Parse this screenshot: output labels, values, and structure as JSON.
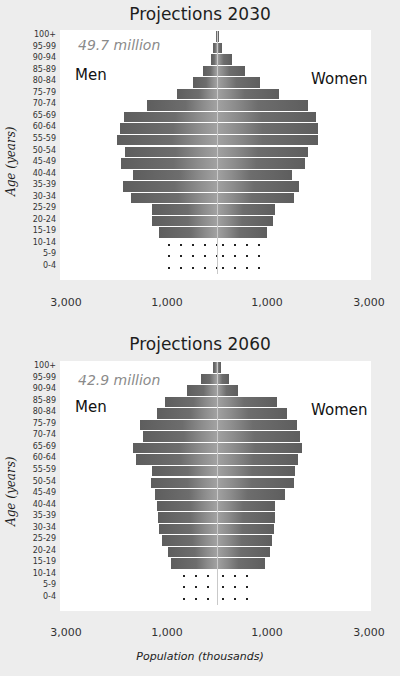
{
  "chart_data": [
    {
      "type": "bar",
      "subtype": "population-pyramid",
      "title": "Projections 2030",
      "total_label": "49.7 million",
      "xlabel": "",
      "ylabel": "Age (years)",
      "left_label": "Men",
      "right_label": "Women",
      "x_ticks": [
        "3,000",
        "1,000",
        "1,000",
        "3,000"
      ],
      "xlim": [
        -3000,
        3000
      ],
      "grid": false,
      "categories": [
        "100+",
        "95-99",
        "90-94",
        "85-89",
        "80-84",
        "75-79",
        "70-74",
        "65-69",
        "60-64",
        "55-59",
        "50-54",
        "45-49",
        "40-44",
        "35-39",
        "30-34",
        "25-29",
        "20-24",
        "15-19",
        "10-14",
        "5-9",
        "0-4"
      ],
      "series": [
        {
          "name": "Men",
          "values": [
            20,
            70,
            120,
            270,
            470,
            780,
            1360,
            1810,
            1880,
            1940,
            1790,
            1860,
            1630,
            1830,
            1670,
            1260,
            1260,
            1130,
            1050,
            1050,
            1050
          ]
        },
        {
          "name": "Women",
          "values": [
            40,
            100,
            290,
            540,
            830,
            1200,
            1770,
            1920,
            1960,
            1960,
            1770,
            1710,
            1460,
            1590,
            1500,
            1130,
            1090,
            970,
            950,
            950,
            950
          ]
        }
      ],
      "dotted_groups": [
        "10-14",
        "5-9",
        "0-4"
      ]
    },
    {
      "type": "bar",
      "subtype": "population-pyramid",
      "title": "Projections 2060",
      "total_label": "42.9 million",
      "xlabel": "Population (thousands)",
      "ylabel": "Age (years)",
      "left_label": "Men",
      "right_label": "Women",
      "x_ticks": [
        "3,000",
        "1,000",
        "1,000",
        "3,000"
      ],
      "xlim": [
        -3000,
        3000
      ],
      "grid": false,
      "categories": [
        "100+",
        "95-99",
        "90-94",
        "85-89",
        "80-84",
        "75-79",
        "70-74",
        "65-69",
        "60-64",
        "55-59",
        "50-54",
        "45-49",
        "40-44",
        "35-39",
        "30-34",
        "25-29",
        "20-24",
        "15-19",
        "10-14",
        "5-9",
        "0-4"
      ],
      "series": [
        {
          "name": "Men",
          "values": [
            70,
            320,
            580,
            1010,
            1160,
            1500,
            1430,
            1640,
            1570,
            1270,
            1290,
            1210,
            1170,
            1150,
            1130,
            1060,
            960,
            890,
            750,
            750,
            750
          ]
        },
        {
          "name": "Women",
          "values": [
            80,
            230,
            400,
            1160,
            1350,
            1560,
            1610,
            1660,
            1570,
            1510,
            1500,
            1320,
            1120,
            1130,
            1100,
            1070,
            1030,
            940,
            740,
            740,
            740
          ]
        }
      ],
      "dotted_groups": [
        "10-14",
        "5-9",
        "0-4"
      ]
    }
  ],
  "ui": {
    "chart1": {
      "title": "Projections 2030",
      "total": "49.7 million",
      "men": "Men",
      "women": "Women"
    },
    "chart2": {
      "title": "Projections 2060",
      "total": "42.9 million",
      "men": "Men",
      "women": "Women"
    },
    "y_title": "Age (years)",
    "x_title": "Population (thousands)",
    "ticks": [
      "3,000",
      "1,000",
      "1,000",
      "3,000"
    ]
  }
}
